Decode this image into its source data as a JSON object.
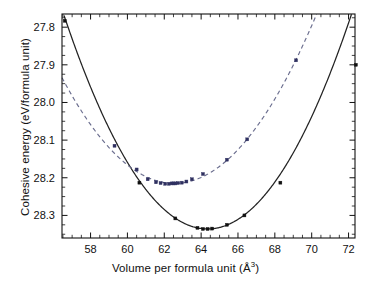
{
  "chart_data": {
    "type": "line",
    "title": "",
    "xlabel": "Volume per formula unit (A^3)",
    "xlabel_text": "Volume per formula unit (",
    "xlabel_unit": "Å",
    "xlabel_exponent": "3",
    "xlabel_close": ")",
    "ylabel": "Cohesive energy (eV/formula unit)",
    "xlim": [
      56.45,
      72.35
    ],
    "ylim": [
      27.765,
      28.36
    ],
    "y_inverted": true,
    "grid": false,
    "legend": "none",
    "x_major_ticks": [
      58,
      60,
      62,
      64,
      66,
      68,
      70,
      72
    ],
    "x_tick_labels": [
      "58",
      "60",
      "62",
      "64",
      "66",
      "68",
      "70",
      "72"
    ],
    "x_minor_step": 0.5,
    "y_major_ticks": [
      27.8,
      27.9,
      28.0,
      28.1,
      28.2,
      28.3
    ],
    "y_tick_labels": [
      "27.8",
      "27.9",
      "28.0",
      "28.1",
      "28.2",
      "28.3"
    ],
    "y_minor_step": 0.025,
    "series": [
      {
        "name": "solid-curve",
        "style": "solid",
        "color": "#232323",
        "marker": "square",
        "marker_color": "#101010",
        "fit_minimum": {
          "x": 64.35,
          "y": 28.336
        },
        "fit_curvature": 0.00935,
        "x_range": [
          56.45,
          72.35
        ],
        "points_x": [
          56.6,
          60.65,
          62.6,
          63.8,
          64.1,
          64.35,
          64.6,
          65.4,
          66.35,
          68.3,
          72.4
        ],
        "points_y": [
          27.783,
          28.213,
          28.308,
          28.333,
          28.336,
          28.336,
          28.335,
          28.325,
          28.3,
          28.213,
          27.9
        ]
      },
      {
        "name": "dashed-curve",
        "style": "dashed",
        "color": "#6a6d8e",
        "marker": "square",
        "marker_color": "#2f3060",
        "fit_minimum": {
          "x": 62.55,
          "y": 28.215
        },
        "fit_curvature": 0.00755,
        "x_range": [
          56.45,
          70.6
        ],
        "points_x": [
          59.3,
          60.5,
          61.1,
          61.55,
          61.8,
          62.05,
          62.25,
          62.4,
          62.5,
          62.6,
          62.75,
          62.95,
          63.2,
          63.5,
          64.1,
          65.4,
          66.5,
          69.15
        ],
        "points_y": [
          28.115,
          28.178,
          28.204,
          28.212,
          28.214,
          28.216,
          28.216,
          28.215,
          28.215,
          28.215,
          28.214,
          28.213,
          28.21,
          28.204,
          28.19,
          28.152,
          28.098,
          27.888
        ]
      }
    ]
  },
  "axes": {
    "frame_color": "#111111",
    "background": "#ffffff"
  }
}
